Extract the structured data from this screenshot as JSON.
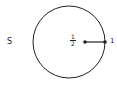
{
  "diagram": {
    "set_label": "S",
    "circle": {
      "cx": 69,
      "cy": 42,
      "r": 36,
      "stroke": "#222222"
    },
    "segment": {
      "x1": 85,
      "y1": 42,
      "x2": 105,
      "y2": 42
    },
    "inner_point_label": {
      "numerator": "1",
      "denominator": "2"
    },
    "outer_point_label": "1",
    "caption": ""
  }
}
